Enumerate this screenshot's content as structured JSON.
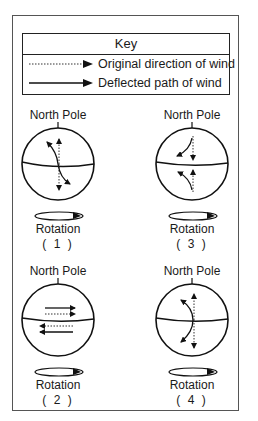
{
  "key": {
    "title": "Key",
    "items": [
      {
        "style": "dotted",
        "label": "Original direction of wind"
      },
      {
        "style": "solid",
        "label": "Deflected path of wind"
      }
    ]
  },
  "panels": [
    {
      "id": "1",
      "top_label": "North Pole",
      "bottom_label": "Rotation",
      "number": "( 1 )"
    },
    {
      "id": "2",
      "top_label": "North Pole",
      "bottom_label": "Rotation",
      "number": "( 2 )"
    },
    {
      "id": "3",
      "top_label": "North Pole",
      "bottom_label": "Rotation",
      "number": "( 3 )"
    },
    {
      "id": "4",
      "top_label": "North Pole",
      "bottom_label": "Rotation",
      "number": "( 4 )"
    }
  ]
}
